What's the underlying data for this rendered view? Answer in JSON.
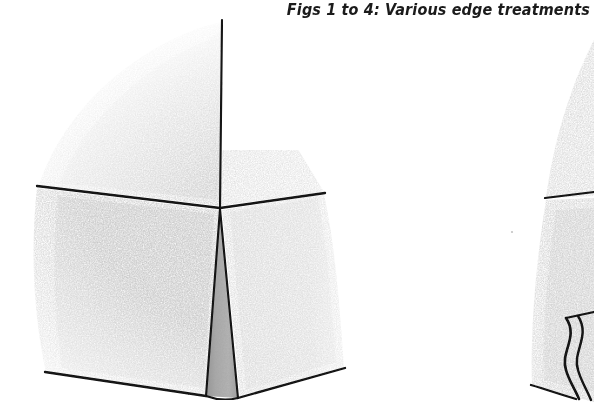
{
  "page": {
    "background_color": "#ffffff",
    "width": 594,
    "height": 412
  },
  "caption": {
    "text": "Figs 1 to 4: Various edge treatments",
    "color": "#1b1b1b",
    "align": "right"
  },
  "figures": [
    {
      "id": "figure-1",
      "name": "cube-corner-chamfered-edge",
      "description": "Pencil sketch of a cube corner with a tapered chamfer running down the vertical edge",
      "medium": "graphite pencil sketch",
      "line_color": "#121212",
      "chamfer_fill_color": "#a8a8a8",
      "shading_color": "#d9d9d9",
      "vertices": {
        "top_edge_start": [
          222,
          20
        ],
        "corner": [
          220,
          208
        ],
        "left_horizontal_end": [
          37,
          186
        ],
        "right_horizontal_end": [
          325,
          193
        ],
        "chamfer_bottom_left": [
          206,
          396
        ],
        "chamfer_bottom_right": [
          238,
          398
        ],
        "bottom_left_end": [
          45,
          372
        ],
        "bottom_right_end": [
          345,
          368
        ]
      }
    },
    {
      "id": "figure-2",
      "name": "cube-corner-ogee-edge",
      "description": "Left sliver of a second cube corner, cropped at the right page border, showing an S-curve (ogee) moulded edge",
      "medium": "graphite pencil sketch",
      "line_color": "#121212",
      "shading_color": "#dcdcdc",
      "vertices": {
        "horizontal_line_start": [
          545,
          198
        ],
        "horizontal_line_end": [
          594,
          193
        ],
        "ogee_top": [
          572,
          322
        ],
        "ogee_bottom": [
          578,
          398
        ],
        "bottom_edge_start": [
          530,
          385
        ],
        "bottom_edge_end": [
          594,
          400
        ]
      }
    }
  ]
}
